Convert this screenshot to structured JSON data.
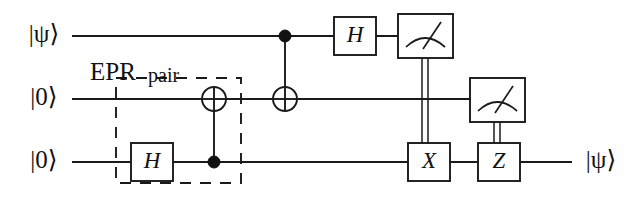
{
  "figure": {
    "kind": "quantum-circuit",
    "background_color": "#ffffff",
    "ink_color": "#1a1a1a"
  },
  "annotations": {
    "epr_label_main": "EPR",
    "epr_label_sub": "pair"
  },
  "wires": [
    {
      "id": "q0",
      "input_label": "|ψ⟩",
      "output_label": "",
      "y": 36,
      "x_start": 72,
      "x_end": 453
    },
    {
      "id": "q1",
      "input_label": "|0⟩",
      "output_label": "",
      "y": 99,
      "x_start": 72,
      "x_end": 525
    },
    {
      "id": "q2",
      "input_label": "|0⟩",
      "output_label": "|ψ⟩",
      "y": 162,
      "x_start": 72,
      "x_end": 572
    }
  ],
  "elements": [
    {
      "name": "hadamard-gate-q2",
      "type": "gate",
      "label": "H",
      "wire": "q2",
      "x": 131,
      "y": 143,
      "width": 42,
      "height": 38
    },
    {
      "name": "cnot-q2-to-q1",
      "type": "cnot",
      "control_wire": "q2",
      "target_wire": "q1",
      "x": 214
    },
    {
      "name": "cnot-q0-to-q1",
      "type": "cnot",
      "control_wire": "q0",
      "target_wire": "q1",
      "x": 285
    },
    {
      "name": "hadamard-gate-q0",
      "type": "gate",
      "label": "H",
      "wire": "q0",
      "x": 334,
      "y": 17,
      "width": 42,
      "height": 38
    },
    {
      "name": "measurement-q0",
      "type": "meter",
      "wire": "q0",
      "x": 398,
      "y": 14,
      "width": 55,
      "height": 44
    },
    {
      "name": "measurement-q1",
      "type": "meter",
      "wire": "q1",
      "x": 470,
      "y": 78,
      "width": 55,
      "height": 44
    },
    {
      "name": "pauli-x-gate",
      "type": "gate",
      "label": "X",
      "wire": "q2",
      "x": 408,
      "y": 143,
      "width": 42,
      "height": 38
    },
    {
      "name": "pauli-z-gate",
      "type": "gate",
      "label": "Z",
      "wire": "q2",
      "x": 478,
      "y": 143,
      "width": 42,
      "height": 38
    }
  ],
  "classical_wires": [
    {
      "name": "classical-wire-x",
      "from": "measurement-q0",
      "to": "pauli-x-gate",
      "x": 425,
      "y_start": 58,
      "y_end": 143
    },
    {
      "name": "classical-wire-z",
      "from": "measurement-q1",
      "to": "pauli-z-gate",
      "x": 497,
      "y_start": 122,
      "y_end": 143
    }
  ],
  "epr_box": {
    "name": "epr-pair-region",
    "x": 116,
    "y": 78,
    "width": 125,
    "height": 105
  }
}
